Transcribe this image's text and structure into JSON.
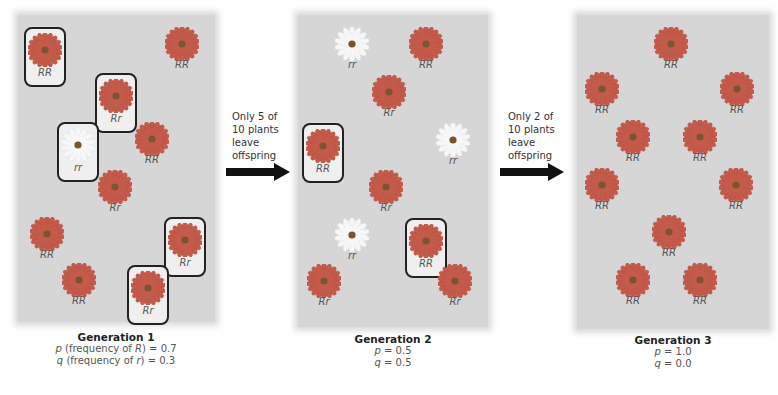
{
  "colors": {
    "panel_bg": "#d6d6d6",
    "red_flower": "#c45a4a",
    "white_flower": "#f7f7f7",
    "flower_center": "#7a5530",
    "box_border": "#222222",
    "arrow": "#111111"
  },
  "generations": [
    {
      "title": "Generation 1",
      "p_line": {
        "var": "p",
        "label": " (frequency of ",
        "allele": "R",
        "close": ") = ",
        "value": "0.7"
      },
      "q_line": {
        "var": "q",
        "label": " (frequency of ",
        "allele": "r",
        "close": ") = ",
        "value": "0.3"
      },
      "plants": [
        {
          "genotype": "RR",
          "color": "red",
          "boxed": true,
          "x": 45,
          "y": 47
        },
        {
          "genotype": "RR",
          "color": "red",
          "boxed": false,
          "x": 182,
          "y": 47
        },
        {
          "genotype": "Rr",
          "color": "red",
          "boxed": true,
          "x": 116,
          "y": 93
        },
        {
          "genotype": "rr",
          "color": "white",
          "boxed": true,
          "x": 78,
          "y": 142
        },
        {
          "genotype": "RR",
          "color": "red",
          "boxed": false,
          "x": 152,
          "y": 142
        },
        {
          "genotype": "Rr",
          "color": "red",
          "boxed": false,
          "x": 115,
          "y": 190
        },
        {
          "genotype": "RR",
          "color": "red",
          "boxed": false,
          "x": 47,
          "y": 237
        },
        {
          "genotype": "Rr",
          "color": "red",
          "boxed": true,
          "x": 185,
          "y": 237
        },
        {
          "genotype": "RR",
          "color": "red",
          "boxed": false,
          "x": 79,
          "y": 283
        },
        {
          "genotype": "Rr",
          "color": "red",
          "boxed": true,
          "x": 148,
          "y": 285
        }
      ]
    },
    {
      "title": "Generation 2",
      "p_line": {
        "var": "p",
        "label": "",
        "allele": "",
        "close": " = ",
        "value": "0.5"
      },
      "q_line": {
        "var": "q",
        "label": "",
        "allele": "",
        "close": " = ",
        "value": "0.5"
      },
      "plants": [
        {
          "genotype": "rr",
          "color": "white",
          "boxed": false,
          "x": 352,
          "y": 47
        },
        {
          "genotype": "RR",
          "color": "red",
          "boxed": false,
          "x": 426,
          "y": 47
        },
        {
          "genotype": "Rr",
          "color": "red",
          "boxed": false,
          "x": 389,
          "y": 95
        },
        {
          "genotype": "RR",
          "color": "red",
          "boxed": true,
          "x": 323,
          "y": 143
        },
        {
          "genotype": "rr",
          "color": "white",
          "boxed": false,
          "x": 453,
          "y": 143
        },
        {
          "genotype": "Rr",
          "color": "red",
          "boxed": false,
          "x": 386,
          "y": 190
        },
        {
          "genotype": "rr",
          "color": "white",
          "boxed": false,
          "x": 352,
          "y": 238
        },
        {
          "genotype": "RR",
          "color": "red",
          "boxed": true,
          "x": 426,
          "y": 238
        },
        {
          "genotype": "Rr",
          "color": "red",
          "boxed": false,
          "x": 324,
          "y": 284
        },
        {
          "genotype": "Rr",
          "color": "red",
          "boxed": false,
          "x": 455,
          "y": 284
        }
      ]
    },
    {
      "title": "Generation 3",
      "p_line": {
        "var": "p",
        "label": "",
        "allele": "",
        "close": " = ",
        "value": "1.0"
      },
      "q_line": {
        "var": "q",
        "label": "",
        "allele": "",
        "close": " = ",
        "value": "0.0"
      },
      "plants": [
        {
          "genotype": "RR",
          "color": "red",
          "boxed": false,
          "x": 671,
          "y": 47
        },
        {
          "genotype": "RR",
          "color": "red",
          "boxed": false,
          "x": 602,
          "y": 92
        },
        {
          "genotype": "RR",
          "color": "red",
          "boxed": false,
          "x": 737,
          "y": 92
        },
        {
          "genotype": "RR",
          "color": "red",
          "boxed": false,
          "x": 633,
          "y": 140
        },
        {
          "genotype": "RR",
          "color": "red",
          "boxed": false,
          "x": 700,
          "y": 140
        },
        {
          "genotype": "RR",
          "color": "red",
          "boxed": false,
          "x": 602,
          "y": 188
        },
        {
          "genotype": "RR",
          "color": "red",
          "boxed": false,
          "x": 736,
          "y": 188
        },
        {
          "genotype": "RR",
          "color": "red",
          "boxed": false,
          "x": 669,
          "y": 235
        },
        {
          "genotype": "RR",
          "color": "red",
          "boxed": false,
          "x": 633,
          "y": 283
        },
        {
          "genotype": "RR",
          "color": "red",
          "boxed": false,
          "x": 700,
          "y": 283
        }
      ]
    }
  ],
  "transitions": [
    {
      "lines": [
        "Only 5 of",
        "10 plants",
        "leave",
        "offspring"
      ]
    },
    {
      "lines": [
        "Only 2 of",
        "10 plants",
        "leave",
        "offspring"
      ]
    }
  ]
}
